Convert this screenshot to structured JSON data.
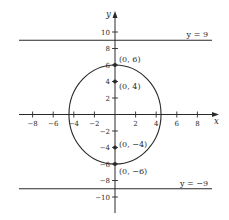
{
  "figure": {
    "type": "ellipse-with-directrices",
    "colors": {
      "ink": "#2a2a2a",
      "background": "#ffffff"
    },
    "axes": {
      "x_label": "x",
      "y_label": "y",
      "x_ticks": [
        {
          "value": -8,
          "label": "−8"
        },
        {
          "value": -6,
          "label": "−6"
        },
        {
          "value": -4,
          "label": "−4"
        },
        {
          "value": -2,
          "label": "−2"
        },
        {
          "value": 2,
          "label": "2"
        },
        {
          "value": 4,
          "label": "4"
        },
        {
          "value": 6,
          "label": "6"
        },
        {
          "value": 8,
          "label": "8"
        }
      ],
      "y_ticks": [
        {
          "value": 10,
          "label": "10"
        },
        {
          "value": 8,
          "label": "8"
        },
        {
          "value": 6,
          "label": "6"
        },
        {
          "value": 4,
          "label": "4"
        },
        {
          "value": 2,
          "label": "2"
        },
        {
          "value": -2,
          "label": "−2"
        },
        {
          "value": -4,
          "label": "−4"
        },
        {
          "value": -6,
          "label": "−6"
        },
        {
          "value": -8,
          "label": "−8"
        },
        {
          "value": -10,
          "label": "−10"
        }
      ]
    },
    "ellipse": {
      "center": [
        0,
        0
      ],
      "semi_major_y": 6,
      "semi_minor_x": 4.47
    },
    "points": [
      {
        "x": 0,
        "y": 6,
        "label": "(0, 6)"
      },
      {
        "x": 0,
        "y": 4,
        "label": "(0, 4)"
      },
      {
        "x": 0,
        "y": -4,
        "label": "(0, −4)"
      },
      {
        "x": 0,
        "y": -6,
        "label": "(0, −6)"
      }
    ],
    "lines": [
      {
        "y": 9,
        "label": "y = 9"
      },
      {
        "y": -9,
        "label": "y = −9"
      }
    ]
  }
}
